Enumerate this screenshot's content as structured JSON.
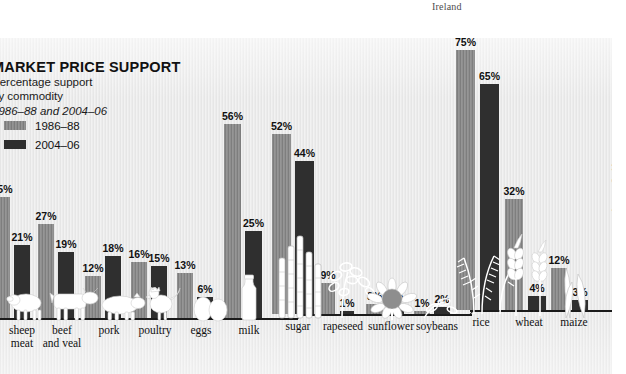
{
  "bleed": {
    "text": "Ireland"
  },
  "header": {
    "title": "MARKET PRICE SUPPORT",
    "subtitle_line1": "Percentage support",
    "subtitle_line2": "by commodity",
    "subtitle_line3": "1986–88 and 2004–06"
  },
  "legend": {
    "position": "top-left",
    "entries": [
      {
        "label": "1986–88",
        "color": "#8b8b8b"
      },
      {
        "label": "2004–06",
        "color": "#2f2f2f"
      }
    ]
  },
  "footer": {
    "copyright": "Copyright © Myriad Editions"
  },
  "colors": {
    "series_1986_88": "#8b8b8b",
    "series_2004_06": "#2f2f2f",
    "background": "#ededed",
    "baseline": "#1b1b1b",
    "text": "#111111"
  },
  "chart_data": {
    "type": "bar",
    "title": "MARKET PRICE SUPPORT",
    "subtitle": "Percentage support by commodity 1986–88 and 2004–06",
    "xlabel": "",
    "ylabel": "Percentage support",
    "ylim": [
      0,
      80
    ],
    "grid": false,
    "legend_position": "top-left",
    "categories": [
      "sheep meat",
      "beef and veal",
      "pork",
      "poultry",
      "eggs",
      "milk",
      "sugar",
      "rapeseed",
      "sunflower",
      "soybeans",
      "rice",
      "wheat",
      "maize"
    ],
    "series": [
      {
        "name": "1986–88",
        "color": "#8b8b8b",
        "values": [
          35,
          27,
          12,
          16,
          13,
          56,
          52,
          9,
          3,
          1,
          75,
          32,
          12
        ],
        "labels": [
          "35%",
          "27%",
          "12%",
          "16%",
          "13%",
          "56%",
          "52%",
          "9%",
          "3%",
          "1%",
          "75%",
          "32%",
          "12%"
        ]
      },
      {
        "name": "2004–06",
        "color": "#2f2f2f",
        "values": [
          21,
          19,
          18,
          15,
          6,
          25,
          44,
          1,
          3,
          2,
          65,
          4,
          3
        ],
        "labels": [
          "21%",
          "19%",
          "18%",
          "15%",
          "6%",
          "25%",
          "44%",
          "1%",
          "3%",
          "2%",
          "65%",
          "4%",
          "3%"
        ]
      }
    ],
    "annotations": [
      {
        "text": "white silhouette illustrations of each commodity sit on the baseline"
      }
    ]
  },
  "illustrations": [
    {
      "name": "sheep-illustration",
      "category": "sheep meat"
    },
    {
      "name": "cow-illustration",
      "category": "beef and veal"
    },
    {
      "name": "pig-illustration",
      "category": "pork"
    },
    {
      "name": "rooster-illustration",
      "category": "poultry"
    },
    {
      "name": "eggs-illustration",
      "category": "eggs"
    },
    {
      "name": "milk-bottle-illustration",
      "category": "milk"
    },
    {
      "name": "sugarcane-illustration",
      "category": "sugar"
    },
    {
      "name": "rapeseed-illustration",
      "category": "rapeseed"
    },
    {
      "name": "sunflower-illustration",
      "category": "sunflower"
    },
    {
      "name": "soybean-illustration",
      "category": "soybeans"
    },
    {
      "name": "rice-plant-illustration",
      "category": "rice"
    },
    {
      "name": "wheat-ears-illustration",
      "category": "wheat"
    },
    {
      "name": "maize-illustration",
      "category": "maize"
    }
  ]
}
